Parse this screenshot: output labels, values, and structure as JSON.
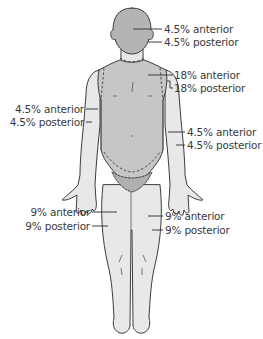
{
  "diagram": {
    "type": "rule-of-nines-body-map",
    "colors": {
      "background": "#ffffff",
      "head": "#b4b4b4",
      "torso": "#c6c6c6",
      "limbs": "#e8e8e8",
      "groin": "#b0b0b0",
      "outline": "#3c3c3c",
      "text": "#3a3a3a"
    },
    "labels": {
      "head": {
        "anterior": "4.5% anterior",
        "posterior": "4.5% posterior"
      },
      "torso": {
        "anterior": "18% anterior",
        "posterior": "18% posterior"
      },
      "left_arm": {
        "anterior": "4.5% anterior",
        "posterior": "4.5% posterior"
      },
      "right_arm": {
        "anterior": "4.5% anterior",
        "posterior": "4.5% posterior"
      },
      "left_leg": {
        "anterior": "9% anterior",
        "posterior": "9% posterior"
      },
      "right_leg": {
        "anterior": "9% anterior",
        "posterior": "9% posterior"
      }
    }
  }
}
